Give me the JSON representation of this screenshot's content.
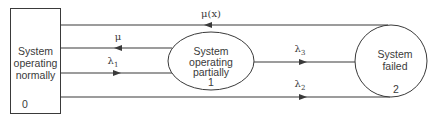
{
  "diagram": {
    "type": "state-transition",
    "states": [
      {
        "id": "0",
        "lines": [
          "System",
          "operating",
          "normally"
        ],
        "number": "0",
        "shape": "rectangle"
      },
      {
        "id": "1",
        "lines": [
          "System",
          "operating",
          "partially"
        ],
        "number": "1",
        "shape": "ellipse"
      },
      {
        "id": "2",
        "lines": [
          "System",
          "failed"
        ],
        "number": "2",
        "shape": "circle"
      }
    ],
    "transitions": [
      {
        "from": "2",
        "to": "0",
        "label": "μ(x)",
        "label_base": "μ(x)",
        "label_sub": ""
      },
      {
        "from": "1",
        "to": "0",
        "label": "μ",
        "label_base": "μ",
        "label_sub": ""
      },
      {
        "from": "0",
        "to": "1",
        "label": "λ1",
        "label_base": "λ",
        "label_sub": "1"
      },
      {
        "from": "1",
        "to": "2",
        "label": "λ3",
        "label_base": "λ",
        "label_sub": "3"
      },
      {
        "from": "0",
        "to": "2",
        "label": "λ2",
        "label_base": "λ",
        "label_sub": "2"
      }
    ],
    "colors": {
      "stroke": "#3a3a3a",
      "background": "#ffffff"
    }
  }
}
